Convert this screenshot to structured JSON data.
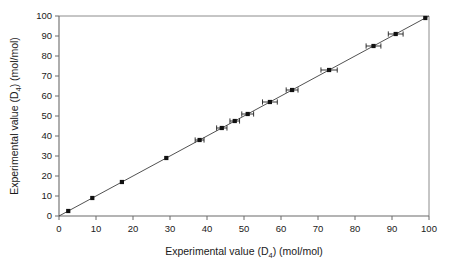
{
  "chart_data": {
    "type": "scatter",
    "title": "",
    "xlabel": "Experimental value (D4) (mol/mol)",
    "xlabel_main": "Experimental value (D",
    "xlabel_sub": "4",
    "xlabel_tail": ") (mol/mol)",
    "ylabel": "Experimental value (D4) (mol/mol)",
    "ylabel_main": "Experimental value (D",
    "ylabel_sub": "4",
    "ylabel_tail": ") (mol/mol)",
    "xlim": [
      0,
      100
    ],
    "ylim": [
      0,
      100
    ],
    "xticks": [
      0,
      10,
      20,
      30,
      40,
      50,
      60,
      70,
      80,
      90,
      100
    ],
    "yticks": [
      0,
      10,
      20,
      30,
      40,
      50,
      60,
      70,
      80,
      90,
      100
    ],
    "xtick_labels": [
      "0",
      "10",
      "20",
      "30",
      "40",
      "50",
      "60",
      "70",
      "80",
      "90",
      "100"
    ],
    "ytick_labels": [
      "0",
      "10",
      "20",
      "30",
      "40",
      "50",
      "60",
      "70",
      "80",
      "90",
      "100"
    ],
    "grid": false,
    "legend": null,
    "marker_style": "filled-square",
    "marker_color": "#111111",
    "line_color": "#3d3d3d",
    "frame_color": "#8c8c8c",
    "x": [
      2.5,
      9.0,
      17.0,
      29.0,
      38.0,
      44.0,
      47.5,
      51.0,
      57.0,
      63.0,
      73.0,
      85.0,
      91.0,
      99.0
    ],
    "y": [
      2.5,
      9.0,
      17.0,
      29.0,
      38.0,
      44.0,
      47.5,
      51.0,
      57.0,
      63.0,
      73.0,
      85.0,
      91.0,
      99.0
    ],
    "xerr": [
      0,
      0,
      0,
      0,
      1.2,
      1.4,
      1.3,
      1.6,
      2.0,
      1.6,
      2.2,
      2.0,
      2.0,
      0
    ],
    "series": [
      {
        "name": "parity",
        "type": "line",
        "x": [
          0,
          100
        ],
        "y": [
          0,
          100
        ]
      }
    ]
  }
}
